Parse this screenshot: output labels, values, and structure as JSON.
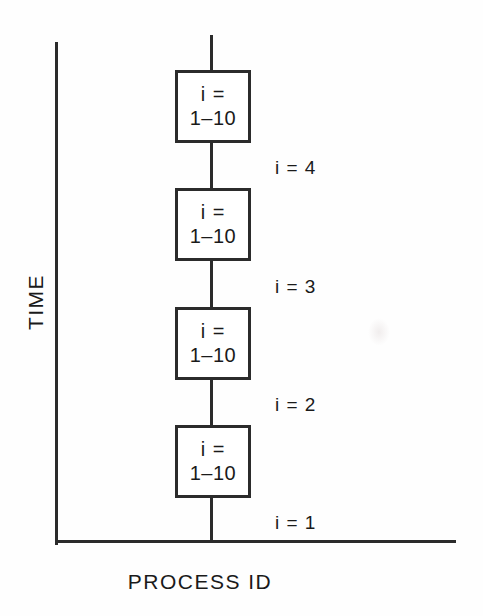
{
  "diagram": {
    "axes": {
      "y_label": "TIME",
      "x_label": "PROCESS ID",
      "line_color": "#2b2b2b"
    },
    "boxes": [
      {
        "line1": "i =",
        "line2": "1–10"
      },
      {
        "line1": "i =",
        "line2": "1–10"
      },
      {
        "line1": "i =",
        "line2": "1–10"
      },
      {
        "line1": "i =",
        "line2": "1–10"
      }
    ],
    "iteration_labels": [
      {
        "text": "i = 4"
      },
      {
        "text": "i = 3"
      },
      {
        "text": "i = 2"
      },
      {
        "text": "i = 1"
      }
    ]
  }
}
